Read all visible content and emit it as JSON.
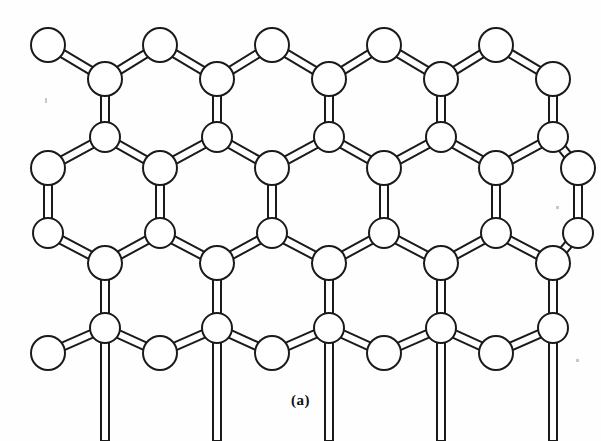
{
  "figure": {
    "caption": "(a)",
    "caption_x": 0,
    "caption_y": 398,
    "width": 601,
    "height": 441,
    "background_color": "#fefefe",
    "line_color": "#1a1a1a",
    "fill_color": "#ffffff"
  },
  "lattice": {
    "atom_radius_large": 17,
    "atom_radius_small": 15,
    "bond_half_width": 4,
    "stroke_width": 2,
    "columns_major": [
      48,
      160,
      272,
      384,
      496
    ],
    "columns_minor": [
      105,
      217,
      329,
      441,
      553
    ],
    "row_y": [
      45,
      79,
      137,
      168,
      233,
      263,
      328,
      353
    ],
    "rows": [
      {
        "id": "row-1-top-edge",
        "y": 45,
        "x": [
          48,
          160,
          272,
          384,
          496
        ],
        "radius": 17
      },
      {
        "id": "row-2-upper",
        "y": 79,
        "x": [
          105,
          217,
          329,
          441,
          553
        ],
        "radius": 17
      },
      {
        "id": "row-3-lower",
        "y": 137,
        "x": [
          105,
          217,
          329,
          441,
          553
        ],
        "radius": 15
      },
      {
        "id": "row-4-upper",
        "y": 168,
        "x": [
          48,
          160,
          272,
          384,
          496,
          578
        ],
        "radius": 17
      },
      {
        "id": "row-5-lower",
        "y": 233,
        "x": [
          48,
          160,
          272,
          384,
          496,
          578
        ],
        "radius": 15
      },
      {
        "id": "row-6-upper",
        "y": 263,
        "x": [
          105,
          217,
          329,
          441,
          553
        ],
        "radius": 17
      },
      {
        "id": "row-7-lower",
        "y": 328,
        "x": [
          105,
          217,
          329,
          441,
          553
        ],
        "radius": 15
      },
      {
        "id": "row-8-bottom",
        "y": 353,
        "x": [
          48,
          160,
          272,
          384,
          496
        ],
        "radius": 17
      }
    ],
    "bond_types": {
      "vertical": "double-line vertical bond connecting an upper atom to the lower atom directly beneath it",
      "diagonal": "double-line slanted bond forming the 109-degree tetrahedral angles of the honeycomb"
    },
    "counts": {
      "atoms_total": 42,
      "rings_visible": 20,
      "rows": 8,
      "columns_major": 5,
      "columns_minor": 5
    }
  },
  "artifacts": {
    "specks": [
      {
        "name": "scan-speck-left",
        "x": 45,
        "y": 98,
        "w": 2,
        "h": 5
      },
      {
        "name": "scan-speck-right",
        "x": 556,
        "y": 206,
        "w": 3,
        "h": 3
      },
      {
        "name": "scan-speck-bottom",
        "x": 576,
        "y": 359,
        "w": 3,
        "h": 3
      }
    ]
  }
}
